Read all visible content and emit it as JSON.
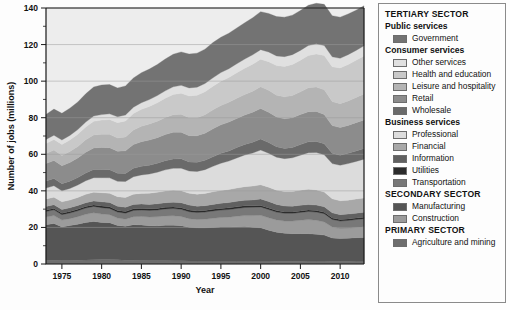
{
  "chart_data": {
    "type": "area",
    "title": "",
    "xlabel": "Year",
    "ylabel": "Number of jobs (millions)",
    "xlim": [
      1973,
      2013
    ],
    "ylim": [
      0,
      140
    ],
    "ytick_step": 20,
    "yticks": [
      0,
      20,
      40,
      60,
      80,
      100,
      120,
      140
    ],
    "xticks": [
      1975,
      1980,
      1985,
      1990,
      1995,
      2000,
      2005,
      2010
    ],
    "grid": true,
    "grid_axis": "y",
    "legend_position": "right",
    "stacked": true,
    "stack_order": "bottom-to-top",
    "x": [
      1973,
      1974,
      1975,
      1976,
      1977,
      1978,
      1979,
      1980,
      1981,
      1982,
      1983,
      1984,
      1985,
      1986,
      1987,
      1988,
      1989,
      1990,
      1991,
      1992,
      1993,
      1994,
      1995,
      1996,
      1997,
      1998,
      1999,
      2000,
      2001,
      2002,
      2003,
      2004,
      2005,
      2006,
      2007,
      2008,
      2009,
      2010,
      2011,
      2012,
      2013
    ],
    "series": [
      {
        "name": "Agriculture and mining",
        "sector": "PRIMARY SECTOR",
        "color": "#6e6e6e",
        "values": [
          2.0,
          2.1,
          2.0,
          2.0,
          2.1,
          2.2,
          2.3,
          2.4,
          2.4,
          2.3,
          2.1,
          2.1,
          2.0,
          1.9,
          1.9,
          1.9,
          1.8,
          1.8,
          1.7,
          1.7,
          1.7,
          1.7,
          1.7,
          1.7,
          1.7,
          1.7,
          1.6,
          1.6,
          1.6,
          1.5,
          1.5,
          1.5,
          1.5,
          1.6,
          1.6,
          1.6,
          1.5,
          1.5,
          1.5,
          1.6,
          1.6
        ]
      },
      {
        "name": "Manufacturing",
        "sector": "SECONDARY SECTOR",
        "color": "#555555",
        "values": [
          19.5,
          20.1,
          18.3,
          19.0,
          19.7,
          20.5,
          21.0,
          20.3,
          20.2,
          18.8,
          18.5,
          19.4,
          19.3,
          19.0,
          18.9,
          19.3,
          19.4,
          19.1,
          18.4,
          18.1,
          18.1,
          18.3,
          18.5,
          18.5,
          18.7,
          18.8,
          18.5,
          18.2,
          16.9,
          15.9,
          15.3,
          15.1,
          15.1,
          15.0,
          14.7,
          14.2,
          12.7,
          12.4,
          12.6,
          12.8,
          12.9
        ]
      },
      {
        "name": "Construction",
        "sector": "SECONDARY SECTOR",
        "color": "#9b9b9b",
        "values": [
          4.2,
          4.3,
          3.7,
          3.8,
          4.1,
          4.5,
          4.7,
          4.6,
          4.4,
          4.0,
          3.9,
          4.4,
          4.7,
          4.8,
          5.0,
          5.1,
          5.2,
          5.1,
          4.7,
          4.5,
          4.7,
          5.0,
          5.2,
          5.4,
          5.7,
          6.0,
          6.4,
          6.8,
          6.8,
          6.7,
          6.7,
          6.9,
          7.3,
          7.7,
          7.6,
          7.2,
          6.0,
          5.5,
          5.5,
          5.6,
          5.9
        ]
      },
      {
        "name": "Transportation",
        "sector": "Business services",
        "color": "#787878",
        "values": [
          3.0,
          3.1,
          3.0,
          3.1,
          3.2,
          3.4,
          3.5,
          3.5,
          3.4,
          3.3,
          3.3,
          3.4,
          3.5,
          3.6,
          3.7,
          3.8,
          3.9,
          3.9,
          3.8,
          3.8,
          3.9,
          4.0,
          4.1,
          4.2,
          4.3,
          4.4,
          4.5,
          4.6,
          4.5,
          4.3,
          4.2,
          4.2,
          4.3,
          4.4,
          4.5,
          4.5,
          4.2,
          4.1,
          4.2,
          4.3,
          4.4
        ]
      },
      {
        "name": "Utilities",
        "sector": "Business services",
        "color": "#2a2a2a",
        "values": [
          0.8,
          0.8,
          0.8,
          0.8,
          0.8,
          0.8,
          0.8,
          0.9,
          0.9,
          0.9,
          0.9,
          0.9,
          0.9,
          0.9,
          0.9,
          0.9,
          0.9,
          0.9,
          0.9,
          0.9,
          0.9,
          0.9,
          0.9,
          0.9,
          0.9,
          0.9,
          0.8,
          0.8,
          0.8,
          0.8,
          0.8,
          0.8,
          0.8,
          0.8,
          0.8,
          0.8,
          0.8,
          0.8,
          0.8,
          0.8,
          0.8
        ]
      },
      {
        "name": "Information",
        "sector": "Business services",
        "color": "#606060",
        "values": [
          2.0,
          2.0,
          2.0,
          2.0,
          2.1,
          2.1,
          2.2,
          2.3,
          2.3,
          2.3,
          2.3,
          2.4,
          2.4,
          2.4,
          2.5,
          2.5,
          2.6,
          2.7,
          2.7,
          2.6,
          2.6,
          2.7,
          2.8,
          2.9,
          3.0,
          3.1,
          3.2,
          3.6,
          3.6,
          3.4,
          3.2,
          3.1,
          3.1,
          3.0,
          3.0,
          3.0,
          2.8,
          2.7,
          2.7,
          2.7,
          2.7
        ]
      },
      {
        "name": "Financial",
        "sector": "Business services",
        "color": "#a8a8a8",
        "values": [
          4.0,
          4.1,
          4.2,
          4.3,
          4.4,
          4.6,
          4.8,
          5.0,
          5.1,
          5.2,
          5.4,
          5.6,
          5.8,
          6.1,
          6.3,
          6.4,
          6.5,
          6.6,
          6.5,
          6.6,
          6.7,
          6.9,
          7.0,
          7.1,
          7.2,
          7.4,
          7.6,
          7.7,
          7.8,
          7.8,
          7.9,
          8.0,
          8.2,
          8.4,
          8.3,
          8.1,
          7.7,
          7.6,
          7.6,
          7.7,
          7.8
        ]
      },
      {
        "name": "Professional",
        "sector": "Business services",
        "color": "#dcdcdc",
        "values": [
          6.0,
          6.3,
          6.0,
          6.3,
          6.8,
          7.4,
          7.9,
          8.2,
          8.4,
          8.4,
          8.7,
          9.5,
          10.1,
          10.5,
          11.0,
          11.6,
          12.0,
          12.3,
          12.1,
          12.4,
          13.0,
          13.9,
          14.9,
          15.6,
          16.5,
          17.3,
          18.1,
          19.0,
          18.6,
          18.0,
          18.0,
          18.5,
          19.2,
          20.0,
          20.5,
          20.3,
          19.2,
          19.4,
          20.0,
          20.6,
          21.2
        ]
      },
      {
        "name": "Wholesale",
        "sector": "Consumer services",
        "color": "#6a6a6a",
        "values": [
          3.9,
          4.0,
          3.9,
          4.0,
          4.1,
          4.3,
          4.5,
          4.5,
          4.5,
          4.4,
          4.4,
          4.6,
          4.7,
          4.8,
          4.9,
          5.0,
          5.1,
          5.1,
          5.0,
          5.0,
          5.1,
          5.2,
          5.4,
          5.5,
          5.7,
          5.8,
          5.9,
          6.0,
          5.9,
          5.7,
          5.6,
          5.6,
          5.8,
          5.9,
          6.0,
          6.0,
          5.6,
          5.5,
          5.6,
          5.7,
          5.8
        ]
      },
      {
        "name": "Retail",
        "sector": "Consumer services",
        "color": "#8c8c8c",
        "values": [
          9.5,
          9.8,
          9.8,
          10.2,
          10.7,
          11.3,
          11.8,
          12.0,
          12.0,
          12.0,
          12.4,
          13.0,
          13.5,
          13.8,
          14.0,
          14.3,
          14.6,
          14.6,
          14.4,
          14.5,
          14.8,
          15.3,
          15.6,
          15.8,
          15.9,
          16.1,
          16.4,
          16.7,
          16.5,
          16.3,
          16.2,
          16.3,
          16.4,
          16.5,
          16.4,
          16.1,
          15.2,
          15.1,
          15.3,
          15.5,
          15.7
        ]
      },
      {
        "name": "Leisure and hospitality",
        "sector": "Consumer services",
        "color": "#b4b4b4",
        "values": [
          5.5,
          5.7,
          5.7,
          6.0,
          6.3,
          6.8,
          7.1,
          7.2,
          7.3,
          7.3,
          7.6,
          8.0,
          8.4,
          8.7,
          9.0,
          9.3,
          9.6,
          9.8,
          9.8,
          9.9,
          10.1,
          10.4,
          10.6,
          10.8,
          11.0,
          11.2,
          11.5,
          11.9,
          12.0,
          11.9,
          12.0,
          12.2,
          12.5,
          13.1,
          13.4,
          13.5,
          13.1,
          13.1,
          13.4,
          13.8,
          14.2
        ]
      },
      {
        "name": "Health and education",
        "sector": "Consumer services",
        "color": "#c9c9c9",
        "values": [
          5.5,
          5.8,
          6.0,
          6.3,
          6.6,
          7.0,
          7.4,
          7.8,
          8.1,
          8.4,
          8.7,
          9.0,
          9.3,
          9.7,
          10.1,
          10.6,
          11.1,
          11.5,
          11.9,
          12.3,
          12.6,
          12.9,
          13.3,
          13.6,
          14.0,
          14.4,
          14.8,
          15.1,
          15.6,
          16.2,
          16.6,
          16.9,
          17.2,
          17.6,
          18.1,
          18.7,
          19.1,
          19.5,
          19.9,
          20.3,
          20.8
        ]
      },
      {
        "name": "Other services",
        "sector": "Consumer services",
        "color": "#e0e0e0",
        "values": [
          2.2,
          2.3,
          2.4,
          2.5,
          2.6,
          2.7,
          2.9,
          3.0,
          3.1,
          3.2,
          3.3,
          3.4,
          3.6,
          3.7,
          3.9,
          4.0,
          4.2,
          4.3,
          4.4,
          4.4,
          4.5,
          4.6,
          4.7,
          4.8,
          4.9,
          5.0,
          5.1,
          5.2,
          5.3,
          5.3,
          5.4,
          5.4,
          5.4,
          5.5,
          5.5,
          5.5,
          5.4,
          5.3,
          5.4,
          5.4,
          5.5
        ]
      },
      {
        "name": "Government",
        "sector": "Public services",
        "color": "#737373",
        "values": [
          13.7,
          14.3,
          14.6,
          14.9,
          15.1,
          15.5,
          15.9,
          16.2,
          16.0,
          15.8,
          15.9,
          16.0,
          16.4,
          16.7,
          17.0,
          17.4,
          17.8,
          18.3,
          18.5,
          18.6,
          18.8,
          19.3,
          19.3,
          19.4,
          19.6,
          19.8,
          20.3,
          20.8,
          21.1,
          21.5,
          21.6,
          21.6,
          21.8,
          22.0,
          22.2,
          22.5,
          22.5,
          22.5,
          22.2,
          22.0,
          21.9
        ]
      }
    ]
  },
  "legend": {
    "blocks": [
      {
        "type": "sector",
        "label": "TERTIARY SECTOR"
      },
      {
        "type": "group",
        "label": "Public services",
        "items": [
          {
            "label": "Government",
            "color": "#737373"
          }
        ]
      },
      {
        "type": "group",
        "label": "Consumer services",
        "items": [
          {
            "label": "Other services",
            "color": "#e0e0e0"
          },
          {
            "label": "Health and education",
            "color": "#c9c9c9"
          },
          {
            "label": "Leisure and hospitality",
            "color": "#b4b4b4"
          },
          {
            "label": "Retail",
            "color": "#8c8c8c"
          },
          {
            "label": "Wholesale",
            "color": "#6a6a6a"
          }
        ]
      },
      {
        "type": "group",
        "label": "Business services",
        "items": [
          {
            "label": "Professional",
            "color": "#dcdcdc"
          },
          {
            "label": "Financial",
            "color": "#a8a8a8"
          },
          {
            "label": "Information",
            "color": "#606060"
          },
          {
            "label": "Utilities",
            "color": "#2a2a2a"
          },
          {
            "label": "Transportation",
            "color": "#787878"
          }
        ]
      },
      {
        "type": "sector",
        "label": "SECONDARY SECTOR",
        "items": [
          {
            "label": "Manufacturing",
            "color": "#555555"
          },
          {
            "label": "Construction",
            "color": "#9b9b9b"
          }
        ]
      },
      {
        "type": "sector",
        "label": "PRIMARY SECTOR",
        "items": [
          {
            "label": "Agriculture and mining",
            "color": "#6e6e6e"
          }
        ]
      }
    ]
  }
}
